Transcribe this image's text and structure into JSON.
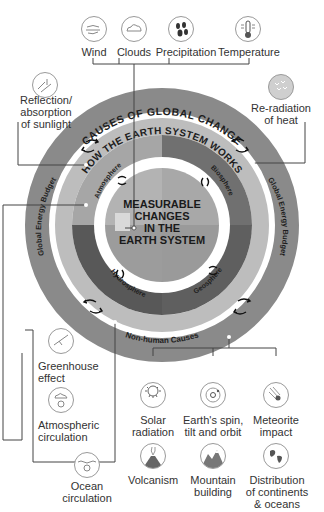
{
  "weather_factors": {
    "items": [
      {
        "label": "Wind",
        "icon": "wind-icon"
      },
      {
        "label": "Clouds",
        "icon": "clouds-icon"
      },
      {
        "label": "Precipitation",
        "icon": "precipitation-icon"
      },
      {
        "label": "Temperature",
        "icon": "thermometer-icon"
      }
    ]
  },
  "energy_factors": {
    "left": {
      "label_line1": "Reflection/",
      "label_line2": "absorption",
      "label_line3": "of sunlight",
      "icon": "sunlight-reflection-icon"
    },
    "right": {
      "label_line1": "Re-radiation",
      "label_line2": "of heat",
      "icon": "heat-radiation-icon"
    }
  },
  "rings": {
    "outer_title": "CAUSES OF GLOBAL CHANGE",
    "outer_left": "Human Causes",
    "outer_right": "Human Causes",
    "outer_bottom": "Non-human Causes",
    "middle_title": "HOW THE EARTH SYSTEM WORKS",
    "middle_left": "Global Energy Budget",
    "middle_right": "Global Energy Budget",
    "spheres": [
      "Atmosphere",
      "Biosphere",
      "Hydrosphere",
      "Geosphere"
    ],
    "center_lines": [
      "MEASURABLE",
      "CHANGES",
      "IN THE",
      "EARTH SYSTEM"
    ]
  },
  "circulation_factors": {
    "items": [
      {
        "label_line1": "Greenhouse",
        "label_line2": "effect",
        "icon": "greenhouse-icon"
      },
      {
        "label_line1": "Atmospheric",
        "label_line2": "circulation",
        "icon": "atmospheric-circulation-icon"
      },
      {
        "label_line1": "Ocean",
        "label_line2": "circulation",
        "icon": "ocean-circulation-icon"
      }
    ]
  },
  "non_human_causes": {
    "items": [
      {
        "label_line1": "Solar",
        "label_line2": "radiation",
        "icon": "sun-icon"
      },
      {
        "label_line1": "Earth's spin,",
        "label_line2": "tilt and orbit",
        "icon": "orbit-icon"
      },
      {
        "label_line1": "Meteorite",
        "label_line2": "impact",
        "icon": "meteorite-icon"
      },
      {
        "label_line1": "Volcanism",
        "label_line2": "",
        "icon": "volcano-icon"
      },
      {
        "label_line1": "Mountain",
        "label_line2": "building",
        "icon": "mountain-icon"
      },
      {
        "label_line1": "Distribution",
        "label_line2": "of continents",
        "label_line3": "& oceans",
        "icon": "globe-icon"
      }
    ]
  },
  "colors": {
    "outer_ring": "#8a8a8a",
    "middle_ring": "#b8b8b8",
    "sphere_atmosphere": "#a3a3a3",
    "sphere_biosphere": "#6e6e6e",
    "sphere_hydrosphere": "#5a5a5a",
    "sphere_geosphere": "#5e5e5e",
    "center": "#9c9c9c",
    "lines": "#444444"
  }
}
